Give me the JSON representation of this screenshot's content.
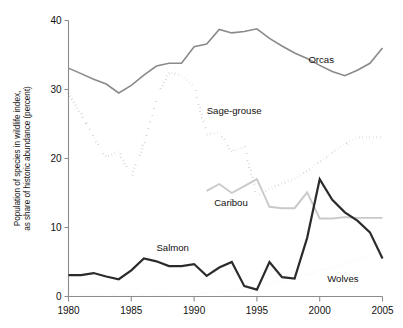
{
  "chart_data": {
    "type": "line",
    "title": "",
    "xlabel": "",
    "ylabel": "Population of species in wildlife index, as share of historic abundance (percent)",
    "ylabel_line1": "Population of species in wildlife index,",
    "ylabel_line2": "as share of historic abundance (percent)",
    "xlim": [
      1980,
      2005
    ],
    "ylim": [
      0,
      40
    ],
    "xticks": [
      1980,
      1985,
      1990,
      1995,
      2000,
      2005
    ],
    "xtick_labels": [
      "1980",
      "1985",
      "1990",
      "1995",
      "2000",
      "2005"
    ],
    "yticks": [
      0,
      10,
      20,
      30,
      40
    ],
    "ytick_labels": [
      "0",
      "10",
      "20",
      "30",
      "40"
    ],
    "grid": false,
    "legend_position": "inline-annotations",
    "series": [
      {
        "name": "Orcas",
        "style": "solid",
        "color": "#8a8a8a",
        "stroke_width": 1.6,
        "label_x": 1999.1,
        "label_y": 33.9,
        "x": [
          1980,
          1981,
          1982,
          1983,
          1984,
          1985,
          1986,
          1987,
          1988,
          1989,
          1990,
          1991,
          1992,
          1993,
          1994,
          1995,
          1996,
          1997,
          1998,
          1999,
          2000,
          2001,
          2002,
          2003,
          2004,
          2005
        ],
        "values": [
          33.1,
          32.3,
          31.5,
          30.8,
          29.5,
          30.6,
          32.1,
          33.4,
          33.8,
          33.8,
          36.2,
          36.6,
          38.7,
          38.2,
          38.4,
          38.8,
          37.4,
          36.3,
          35.3,
          34.5,
          33.5,
          32.6,
          32.0,
          32.8,
          33.8,
          36.0
        ]
      },
      {
        "name": "Sage-grouse",
        "style": "dotted-heavy",
        "color": "#1c1c1c",
        "stroke_width": 2.6,
        "label_x": 1991.0,
        "label_y": 26.4,
        "x": [
          1980,
          1981,
          1982,
          1983,
          1984,
          1985,
          1986,
          1987,
          1988,
          1989,
          1990,
          1991,
          1992,
          1993,
          1994,
          1995,
          1996,
          1997,
          1998,
          1999,
          2000,
          2001,
          2002,
          2003,
          2004,
          2005
        ],
        "values": [
          29.5,
          26.5,
          23.0,
          20.2,
          21.0,
          17.3,
          22.2,
          28.8,
          32.5,
          32.0,
          30.5,
          23.5,
          23.8,
          21.0,
          21.7,
          14.7,
          15.6,
          16.4,
          17.0,
          18.2,
          19.5,
          20.9,
          22.0,
          23.1,
          23.1,
          23.1
        ]
      },
      {
        "name": "Caribou",
        "style": "solid",
        "color": "#c9c9c9",
        "stroke_width": 1.9,
        "label_x": 1991.6,
        "label_y": 13.1,
        "x": [
          1991,
          1992,
          1993,
          1994,
          1995,
          1996,
          1997,
          1998,
          1999,
          2000,
          2001,
          2002,
          2003,
          2004,
          2005
        ],
        "values": [
          15.3,
          16.3,
          15.0,
          16.0,
          17.0,
          13.0,
          12.8,
          12.8,
          15.1,
          11.3,
          11.3,
          11.5,
          11.4,
          11.4,
          11.4
        ]
      },
      {
        "name": "Salmon",
        "style": "solid",
        "color": "#2b2b2b",
        "stroke_width": 2.2,
        "label_x": 1987.0,
        "label_y": 6.6,
        "x": [
          1980,
          1981,
          1982,
          1983,
          1984,
          1985,
          1986,
          1987,
          1988,
          1989,
          1990,
          1991,
          1992,
          1993,
          1994,
          1995,
          1996,
          1997,
          1998,
          1999,
          2000,
          2001,
          2002,
          2003,
          2004,
          2005
        ],
        "values": [
          3.1,
          3.1,
          3.4,
          2.9,
          2.5,
          3.8,
          5.5,
          5.1,
          4.4,
          4.4,
          4.7,
          3.0,
          4.2,
          5.0,
          1.5,
          1.0,
          5.0,
          2.8,
          2.6,
          8.5,
          17.0,
          14.0,
          12.2,
          11.0,
          9.3,
          5.5
        ]
      },
      {
        "name": "Wolves",
        "style": "dotted-fine",
        "color": "#9a9a9a",
        "stroke_width": 1.5,
        "label_x": 2000.6,
        "label_y": 2.1,
        "x": [
          1980,
          1985,
          1990,
          1991,
          1993,
          1995,
          1997,
          1999,
          2001,
          2003,
          2005
        ],
        "values": [
          0.22,
          0.22,
          0.3,
          0.5,
          0.9,
          1.5,
          2.3,
          3.2,
          4.2,
          5.3,
          6.5
        ]
      }
    ]
  },
  "axis": {
    "y_title_line1": "Population of species in wildlife index,",
    "y_title_line2": "as share of historic abundance (percent)"
  }
}
